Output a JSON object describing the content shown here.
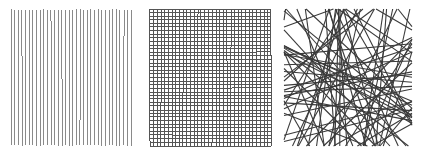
{
  "figure": {
    "name": "line-pattern-comparison",
    "background_color": "#ffffff",
    "width": 422,
    "height": 154,
    "panel_count": 3
  },
  "panels": [
    {
      "id": "parallel-lines",
      "name": "parallel-vertical-lines-panel",
      "pattern": "parallel",
      "description": "Evenly spaced near-vertical parallel lines",
      "stroke_color": "#8a8a8a",
      "stroke_width": 1.0,
      "line_count": 34,
      "origin_x": 11,
      "origin_y": 9,
      "box_width": 120,
      "box_height": 137,
      "spacing": 3.64,
      "jitter": 0.35
    },
    {
      "id": "grid-lines",
      "name": "orthogonal-grid-lines-panel",
      "pattern": "grid",
      "description": "Crosshatch of near-vertical and near-horizontal lines forming a dense mesh",
      "stroke_color": "#555555",
      "stroke_width": 1.0,
      "vertical_line_count": 34,
      "horizontal_line_count": 39,
      "origin_x": 10,
      "origin_y": 9,
      "box_width": 121,
      "box_height": 137,
      "spacing_x": 3.67,
      "spacing_y": 3.6,
      "jitter": 0.4
    },
    {
      "id": "random-lines",
      "name": "random-orientation-lines-panel",
      "pattern": "random",
      "description": "Straight chords at random angles and positions crossing the square",
      "stroke_color": "#3a3a3a",
      "stroke_width": 1.1,
      "line_count": 72,
      "origin_x": 6,
      "origin_y": 9,
      "box_width": 128,
      "box_height": 137
    }
  ],
  "colors": {
    "background": "#ffffff",
    "light_gray_stroke": "#8a8a8a",
    "mid_gray_stroke": "#555555",
    "dark_gray_stroke": "#3a3a3a"
  }
}
